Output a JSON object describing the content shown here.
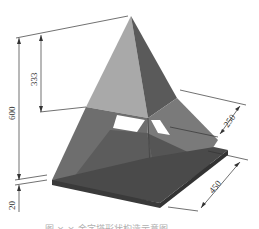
{
  "figure": {
    "type": "isometric technical drawing",
    "colors": {
      "background": "#ffffff",
      "face_light": "#a6a6a6",
      "face_dark": "#5e5e5e",
      "face_mid": "#7c7c7c",
      "base_dark": "#3f3f3f",
      "opening": "#ffffff",
      "dimension_line": "#333333"
    }
  },
  "dimensions": {
    "total_height": "600",
    "upper_height": "333",
    "base_thickness": "20",
    "opening_width": "250",
    "base_side": "450"
  },
  "caption": {
    "text": "图 × ×  金字塔形状构造示意图",
    "clipped": true
  }
}
